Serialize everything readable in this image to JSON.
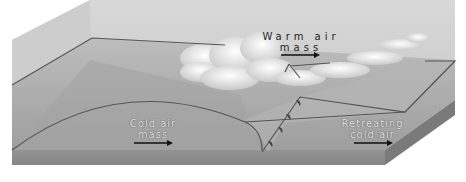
{
  "diagram": {
    "labels": {
      "warm_air": {
        "line1": "Warm air",
        "line2": "mass",
        "arrow": "right-arrow"
      },
      "cold_air": {
        "line1": "Cold air",
        "line2": "mass",
        "arrow": "right-arrow"
      },
      "retreating": {
        "line1": "Retreating",
        "line2": "cold air",
        "arrow": "right-arrow"
      }
    },
    "front_symbol": "warm-front-semicircles",
    "colors": {
      "background": "#ffffff",
      "box_back": "#cfcfcf",
      "box_right": "#bdbdbd",
      "ground_top": "#a8a8a8",
      "ground_front": "#8c8c8c",
      "ground_side": "#7a7a7a",
      "frontal_plane": "#b8b8b8",
      "outline": "#555555",
      "cloud": "#f2f2f2",
      "arrow": "#111111"
    }
  }
}
